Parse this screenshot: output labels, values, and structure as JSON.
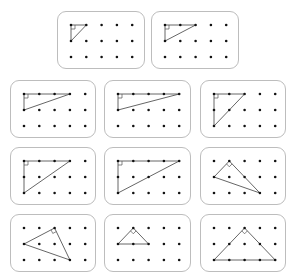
{
  "colors": {
    "border": "#bdbdbd",
    "dot": "#111111",
    "line": "#555555"
  },
  "grid": {
    "cols": 5,
    "rows": 3
  },
  "cards": [
    {
      "id": "card-1",
      "x": 57,
      "y": 11,
      "w": 88,
      "h": 58,
      "triangle": [
        [
          0,
          0
        ],
        [
          1,
          0
        ],
        [
          0,
          1
        ]
      ],
      "right_angle": [
        0,
        0
      ]
    },
    {
      "id": "card-2",
      "x": 151,
      "y": 11,
      "w": 88,
      "h": 58,
      "triangle": [
        [
          0,
          0
        ],
        [
          2,
          0
        ],
        [
          0,
          1
        ]
      ],
      "right_angle": [
        0,
        0
      ]
    },
    {
      "id": "card-3",
      "x": 10,
      "y": 80,
      "w": 86,
      "h": 58,
      "triangle": [
        [
          0,
          0
        ],
        [
          3,
          0
        ],
        [
          0,
          1
        ]
      ],
      "right_angle": [
        0,
        0
      ]
    },
    {
      "id": "card-4",
      "x": 104,
      "y": 80,
      "w": 87,
      "h": 58,
      "triangle": [
        [
          0,
          0
        ],
        [
          4,
          0
        ],
        [
          0,
          1
        ]
      ],
      "right_angle": [
        0,
        0
      ]
    },
    {
      "id": "card-5",
      "x": 200,
      "y": 80,
      "w": 86,
      "h": 58,
      "triangle": [
        [
          0,
          0
        ],
        [
          2,
          0
        ],
        [
          0,
          2
        ]
      ],
      "right_angle": [
        0,
        0
      ]
    },
    {
      "id": "card-6",
      "x": 10,
      "y": 147,
      "w": 86,
      "h": 58,
      "triangle": [
        [
          0,
          0
        ],
        [
          3,
          0
        ],
        [
          0,
          2
        ]
      ],
      "right_angle": [
        0,
        0
      ]
    },
    {
      "id": "card-7",
      "x": 104,
      "y": 147,
      "w": 87,
      "h": 58,
      "triangle": [
        [
          0,
          0
        ],
        [
          4,
          0
        ],
        [
          0,
          2
        ]
      ],
      "right_angle": [
        0,
        0
      ]
    },
    {
      "id": "card-8",
      "x": 200,
      "y": 147,
      "w": 86,
      "h": 58,
      "triangle": [
        [
          1,
          0
        ],
        [
          0,
          1
        ],
        [
          3,
          2
        ]
      ],
      "right_angle": [
        1,
        0
      ]
    },
    {
      "id": "card-9",
      "x": 10,
      "y": 214,
      "w": 86,
      "h": 58,
      "triangle": [
        [
          2,
          0
        ],
        [
          0,
          1
        ],
        [
          3,
          2
        ]
      ],
      "right_angle": [
        2,
        0
      ]
    },
    {
      "id": "card-10",
      "x": 104,
      "y": 214,
      "w": 87,
      "h": 58,
      "triangle": [
        [
          1,
          0
        ],
        [
          0,
          1
        ],
        [
          2,
          1
        ]
      ],
      "right_angle": [
        1,
        0
      ]
    },
    {
      "id": "card-11",
      "x": 200,
      "y": 214,
      "w": 86,
      "h": 58,
      "triangle": [
        [
          2,
          0
        ],
        [
          0,
          2
        ],
        [
          4,
          2
        ]
      ],
      "right_angle": [
        2,
        0
      ]
    }
  ]
}
